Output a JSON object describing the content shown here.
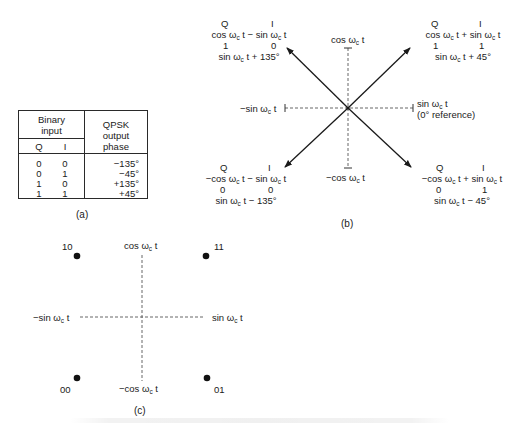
{
  "figure": {
    "panels": {
      "a": {
        "caption": "(a)",
        "table": {
          "group_header": [
            "Binary",
            "input"
          ],
          "col_q": "Q",
          "col_i": "I",
          "phase_header": [
            "QPSK",
            "output",
            "phase"
          ],
          "rows": [
            {
              "q": "0",
              "i": "0",
              "phase": "−135°"
            },
            {
              "q": "0",
              "i": "1",
              "phase": "−45°"
            },
            {
              "q": "1",
              "i": "0",
              "phase": "+135°"
            },
            {
              "q": "1",
              "i": "1",
              "phase": "+45°"
            }
          ]
        }
      },
      "b": {
        "caption": "(b)",
        "axes": {
          "top": {
            "pre": "cos ω",
            "sub": "c",
            "post": " t"
          },
          "bottom": {
            "pre": "−cos ω",
            "sub": "c",
            "post": " t"
          },
          "left": {
            "pre": "−sin ω",
            "sub": "c",
            "post": " t"
          },
          "right": {
            "pre": "sin ω",
            "sub": "c",
            "post": " t"
          },
          "right_note": "(0° reference)"
        },
        "phasors": {
          "upper_left": {
            "q_label": "Q",
            "i_label": "I",
            "expr": {
              "a_pre": "cos ω",
              "a_sub": "c",
              "a_post": " t − sin ω",
              "b_sub": "c",
              "b_post": " t"
            },
            "q_bit": "1",
            "i_bit": "0",
            "result": {
              "pre": "sin ω",
              "sub": "c",
              "post": " t + 135°"
            }
          },
          "upper_right": {
            "q_label": "Q",
            "i_label": "I",
            "expr": {
              "a_pre": "cos ω",
              "a_sub": "c",
              "a_post": " t + sin ω",
              "b_sub": "c",
              "b_post": " t"
            },
            "q_bit": "1",
            "i_bit": "1",
            "result": {
              "pre": "sin ω",
              "sub": "c",
              "post": " t + 45°"
            }
          },
          "lower_left": {
            "q_label": "Q",
            "i_label": "I",
            "expr": {
              "a_pre": "−cos ω",
              "a_sub": "c",
              "a_post": " t − sin ω",
              "b_sub": "c",
              "b_post": " t"
            },
            "q_bit": "0",
            "i_bit": "0",
            "result": {
              "pre": "sin ω",
              "sub": "c",
              "post": " t − 135°"
            }
          },
          "lower_right": {
            "q_label": "Q",
            "i_label": "I",
            "expr": {
              "a_pre": "−cos ω",
              "a_sub": "c",
              "a_post": " t + sin ω",
              "b_sub": "c",
              "b_post": " t"
            },
            "q_bit": "0",
            "i_bit": "1",
            "result": {
              "pre": "sin ω",
              "sub": "c",
              "post": " t − 45°"
            }
          }
        }
      },
      "c": {
        "caption": "(c)",
        "axes": {
          "top": {
            "pre": "cos ω",
            "sub": "c",
            "post": " t"
          },
          "bottom": {
            "pre": "−cos ω",
            "sub": "c",
            "post": " t"
          },
          "left": {
            "pre": "−sin ω",
            "sub": "c",
            "post": " t"
          },
          "right": {
            "pre": "sin ω",
            "sub": "c",
            "post": " t"
          }
        },
        "points": [
          {
            "label": "10",
            "position": "upper-left"
          },
          {
            "label": "11",
            "position": "upper-right"
          },
          {
            "label": "00",
            "position": "lower-left"
          },
          {
            "label": "01",
            "position": "lower-right"
          }
        ]
      }
    }
  }
}
